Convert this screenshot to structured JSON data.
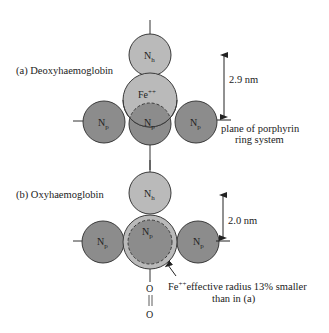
{
  "panel_a": {
    "title": "(a) Deoxyhaemoglobin",
    "atom_top": "N",
    "atom_top_sub": "h",
    "iron": "Fe",
    "iron_charge": "++",
    "atom_left": "N",
    "atom_center": "N",
    "atom_right": "N",
    "atom_p_sub": "p",
    "distance": "2.9 nm",
    "plane_label_line1": "plane of porphyrin",
    "plane_label_line2": "ring system"
  },
  "panel_b": {
    "title": "(b) Oxyhaemoglobin",
    "atom_top": "N",
    "atom_top_sub": "h",
    "atom_left": "N",
    "atom_center": "N",
    "atom_right": "N",
    "atom_p_sub": "p",
    "distance": "2.0 nm",
    "iron": "Fe",
    "iron_charge": "++",
    "iron_note_line1": "effective radius 13% smaller",
    "iron_note_line2": "than in (a)",
    "oxygen_1": "O",
    "oxygen_2": "O"
  },
  "colors": {
    "light_atom": "#bababa",
    "dark_atom": "#8c8c8c",
    "outline": "#3a3a3a"
  }
}
